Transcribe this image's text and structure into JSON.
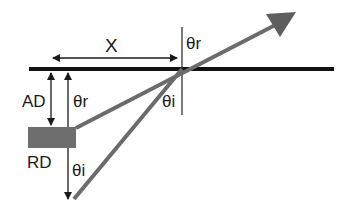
{
  "diagram": {
    "type": "geometry-ray-reflection",
    "labels": {
      "x": "X",
      "ad": "AD",
      "rd": "RD",
      "theta_r_top": "θr",
      "theta_r_left": "θr",
      "theta_i_center": "θi",
      "theta_i_left": "θi"
    },
    "colors": {
      "surface_line": "#111111",
      "ray": "#6b6b6b",
      "source_box": "#6e6e6e",
      "annotation": "#1a1a1a",
      "background": "#ffffff"
    },
    "elements": [
      {
        "id": "surface",
        "desc": "thick horizontal black line"
      },
      {
        "id": "normal",
        "desc": "vertical thin line at point of incidence"
      },
      {
        "id": "x-dimension",
        "desc": "horizontal double arrow labeled X"
      },
      {
        "id": "ad-dimension",
        "desc": "vertical double arrow labeled AD"
      },
      {
        "id": "rd-dimension",
        "desc": "vertical long arrow labeled RD with θr and θi"
      },
      {
        "id": "source-box",
        "desc": "gray rectangle"
      },
      {
        "id": "reflected-ray",
        "desc": "gray line from box through point of incidence to arrowhead"
      },
      {
        "id": "incident-ray",
        "desc": "gray line from lower left to point of incidence"
      }
    ]
  }
}
